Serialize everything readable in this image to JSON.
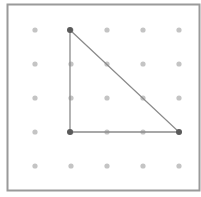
{
  "figure": {
    "type": "geoboard-dot-grid",
    "frame": {
      "x": 7.5,
      "y": 4.5,
      "width": 192,
      "height": 186,
      "stroke": "#9a9a9a"
    },
    "grid": {
      "columns": [
        35,
        71,
        107,
        143,
        179
      ],
      "rows": [
        30,
        64,
        98,
        132,
        166
      ],
      "dot_color": "#c4c4c4",
      "dot_radius": 2.6
    },
    "triangle": {
      "vertices": [
        [
          70,
          30
        ],
        [
          70,
          132
        ],
        [
          179,
          132
        ]
      ],
      "stroke": "#8a8a8a",
      "vertex_color": "#5a5a5a",
      "vertex_radius": 3
    }
  }
}
